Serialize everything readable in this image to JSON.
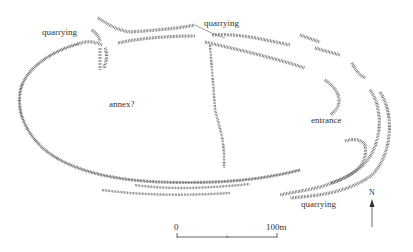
{
  "labels": {
    "quarrying_nw": "quarrying",
    "quarrying_n": "quarrying",
    "annex": "annex?",
    "entrance": "entrance",
    "quarrying_se": "quarrying"
  },
  "scale_bar": {
    "start_label": "0",
    "end_label": "100m"
  },
  "north_arrow": {
    "label": "N"
  },
  "colors": {
    "ink": "#555555",
    "background": "#ffffff"
  }
}
